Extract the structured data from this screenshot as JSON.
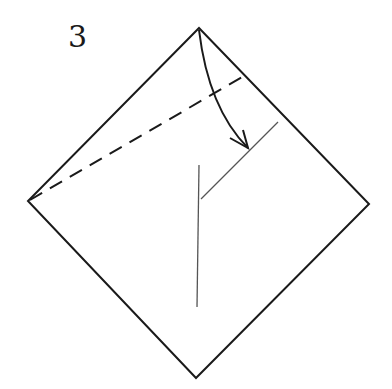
{
  "step_number": "3",
  "colors": {
    "outline": "#1a1a1a",
    "crease": "#555555",
    "background": "#ffffff"
  },
  "elements": {
    "paper": "square-rotated-45",
    "valley_fold_line": "dashed",
    "fold_arrow": "curved-arrow",
    "existing_creases": [
      "diagonal-crease",
      "vertical-crease"
    ]
  }
}
